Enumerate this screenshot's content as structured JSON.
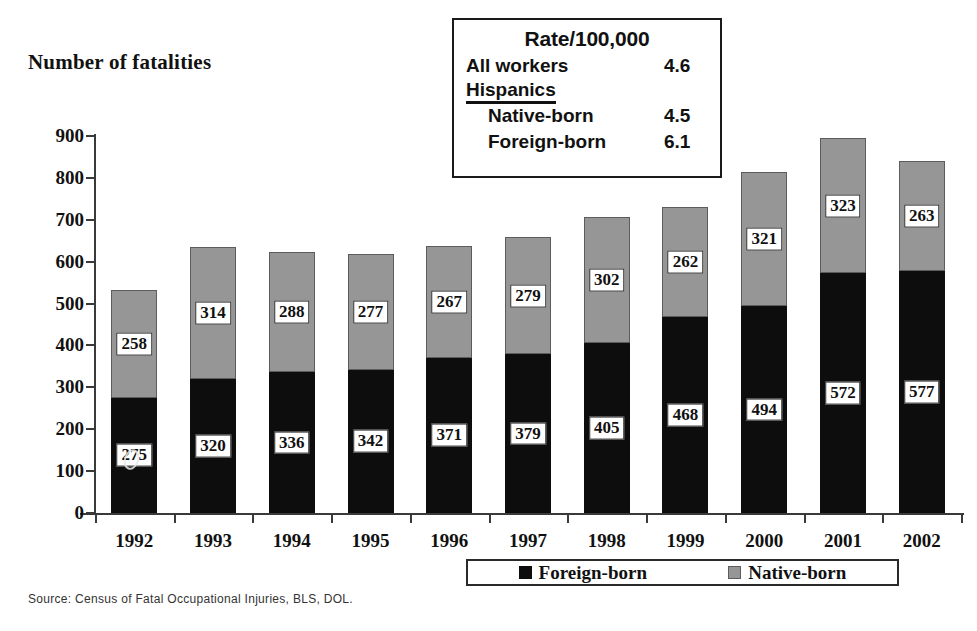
{
  "chart_data": {
    "type": "bar",
    "stacked": true,
    "title": "Number of fatalities",
    "xlabel": "",
    "ylabel": "Number of fatalities",
    "ylim": [
      0,
      900
    ],
    "ytick_step": 100,
    "yticks": [
      900,
      800,
      700,
      600,
      500,
      400,
      300,
      200,
      100,
      0
    ],
    "grid": false,
    "legend_position": "bottom-right",
    "categories": [
      "1992",
      "1993",
      "1994",
      "1995",
      "1996",
      "1997",
      "1998",
      "1999",
      "2000",
      "2001",
      "2002"
    ],
    "series": [
      {
        "name": "Foreign-born",
        "color": "#0d0d0d",
        "values": [
          275,
          320,
          336,
          342,
          371,
          379,
          405,
          468,
          494,
          572,
          577
        ]
      },
      {
        "name": "Native-born",
        "color": "#969696",
        "values": [
          258,
          314,
          288,
          277,
          267,
          279,
          302,
          262,
          321,
          323,
          263
        ]
      }
    ],
    "totals": [
      533,
      634,
      624,
      619,
      638,
      658,
      707,
      730,
      815,
      895,
      840
    ],
    "source": "Source: Census of Fatal Occupational Injuries, BLS, DOL."
  },
  "rate_box": {
    "title": "Rate/100,000",
    "rows": [
      {
        "label": "All workers",
        "value": "4.6",
        "indent": false
      },
      {
        "label": "Native-born",
        "value": "4.5",
        "indent": true
      },
      {
        "label": "Foreign-born",
        "value": "6.1",
        "indent": true
      }
    ],
    "subheading": "Hispanics"
  },
  "legend": {
    "entries": [
      {
        "label": "Foreign-born",
        "swatch": "foreign"
      },
      {
        "label": "Native-born",
        "swatch": "native"
      }
    ]
  },
  "source_note": "Source: Census of Fatal Occupational Injuries, BLS, DOL."
}
